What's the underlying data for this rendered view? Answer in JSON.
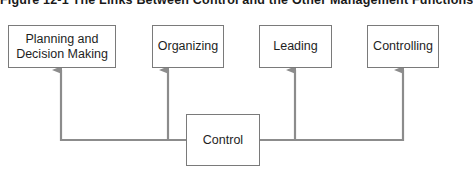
{
  "figure": {
    "title": "Figure 12-1   The Links Between Control and the Other Management Functions"
  },
  "diagram": {
    "source_node": {
      "id": "control",
      "label": "Control"
    },
    "target_nodes": [
      {
        "id": "planning",
        "label_line1": "Planning and",
        "label_line2": "Decision Making"
      },
      {
        "id": "organizing",
        "label": "Organizing"
      },
      {
        "id": "leading",
        "label": "Leading"
      },
      {
        "id": "controlling",
        "label": "Controlling"
      }
    ],
    "edges": [
      {
        "from": "control",
        "to": "planning"
      },
      {
        "from": "control",
        "to": "organizing"
      },
      {
        "from": "control",
        "to": "leading"
      },
      {
        "from": "control",
        "to": "controlling"
      }
    ],
    "colors": {
      "connector": "#8c8c8c",
      "box_border": "#7a7a7a",
      "text": "#1e1e1e"
    }
  }
}
